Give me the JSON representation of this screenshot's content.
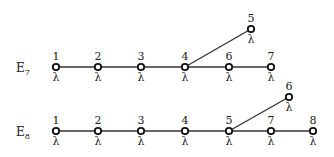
{
  "diagrams": [
    {
      "name": "E",
      "subscript": "7",
      "label_pos": [
        16,
        72
      ],
      "weight_symbol": "λ",
      "nodes": [
        {
          "id": "1",
          "x": 56,
          "y": 67
        },
        {
          "id": "2",
          "x": 98,
          "y": 67
        },
        {
          "id": "3",
          "x": 141,
          "y": 67
        },
        {
          "id": "4",
          "x": 185,
          "y": 67
        },
        {
          "id": "6",
          "x": 229,
          "y": 67
        },
        {
          "id": "7",
          "x": 271,
          "y": 67
        },
        {
          "id": "5",
          "x": 251,
          "y": 29
        }
      ],
      "edges": [
        [
          "1",
          "2"
        ],
        [
          "2",
          "3"
        ],
        [
          "3",
          "4"
        ],
        [
          "4",
          "6"
        ],
        [
          "6",
          "7"
        ],
        [
          "4",
          "5"
        ]
      ]
    },
    {
      "name": "E",
      "subscript": "8",
      "label_pos": [
        16,
        136
      ],
      "weight_symbol": "λ",
      "nodes": [
        {
          "id": "1",
          "x": 56,
          "y": 131
        },
        {
          "id": "2",
          "x": 98,
          "y": 131
        },
        {
          "id": "3",
          "x": 141,
          "y": 131
        },
        {
          "id": "4",
          "x": 185,
          "y": 131
        },
        {
          "id": "5",
          "x": 229,
          "y": 131
        },
        {
          "id": "7",
          "x": 271,
          "y": 131
        },
        {
          "id": "8",
          "x": 313,
          "y": 131
        },
        {
          "id": "6",
          "x": 289,
          "y": 97
        }
      ],
      "edges": [
        [
          "1",
          "2"
        ],
        [
          "2",
          "3"
        ],
        [
          "3",
          "4"
        ],
        [
          "4",
          "5"
        ],
        [
          "5",
          "7"
        ],
        [
          "7",
          "8"
        ],
        [
          "5",
          "6"
        ]
      ]
    }
  ]
}
